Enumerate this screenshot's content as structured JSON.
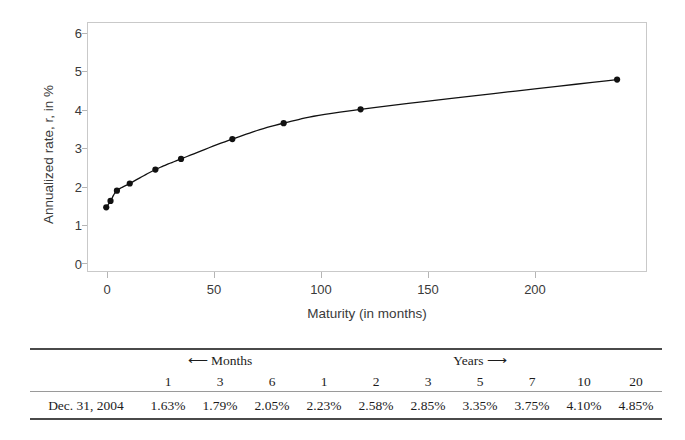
{
  "chart_data": {
    "type": "line",
    "title": "",
    "xlabel": "Maturity (in months)",
    "ylabel": "Annualized rate, r, in %",
    "xlim": [
      -8,
      254
    ],
    "ylim": [
      0,
      6.3
    ],
    "xticks": [
      0,
      50,
      100,
      150,
      200
    ],
    "yticks": [
      0,
      1,
      2,
      3,
      4,
      5,
      6
    ],
    "grid": false,
    "legend": "none",
    "marker": "filled-circle",
    "line_color": "#111111",
    "marker_color": "#111111",
    "x": [
      1,
      3,
      6,
      12,
      24,
      36,
      60,
      84,
      120,
      240
    ],
    "y": [
      1.63,
      1.79,
      2.05,
      2.23,
      2.58,
      2.85,
      3.35,
      3.75,
      4.1,
      4.85
    ],
    "series": [
      {
        "name": "Dec. 31, 2004 yield curve",
        "x": [
          1,
          3,
          6,
          12,
          24,
          36,
          60,
          84,
          120,
          240
        ],
        "values": [
          1.63,
          1.79,
          2.05,
          2.23,
          2.58,
          2.85,
          3.35,
          3.75,
          4.1,
          4.85
        ]
      }
    ]
  },
  "axes": {
    "y_title": "Annualized rate, r, in %",
    "x_title": "Maturity (in months)",
    "y_tick_labels": [
      "6",
      "5",
      "4",
      "3",
      "2",
      "1",
      "0"
    ],
    "x_tick_labels": [
      "0",
      "50",
      "100",
      "150",
      "200"
    ]
  },
  "table": {
    "group_months_label": "⟵  Months",
    "group_years_label": "Years  ⟶",
    "corner_label": "",
    "columns": [
      "1",
      "3",
      "6",
      "1",
      "2",
      "3",
      "5",
      "7",
      "10",
      "20"
    ],
    "rows": [
      {
        "label": "Dec. 31, 2004",
        "values": [
          "1.63%",
          "1.79%",
          "2.05%",
          "2.23%",
          "2.58%",
          "2.85%",
          "3.35%",
          "3.75%",
          "4.10%",
          "4.85%"
        ]
      }
    ]
  }
}
